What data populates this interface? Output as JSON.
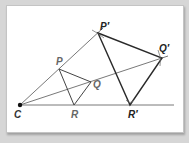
{
  "diagram": {
    "type": "dilation",
    "colors": {
      "background": "#d6d6d6",
      "panel": "#ffffff",
      "thin_line": "#555555",
      "image_line": "#333333",
      "original_label": "#666666",
      "image_label": "#222222"
    },
    "center": {
      "label": "C",
      "x": 20,
      "y": 105
    },
    "original": {
      "P": {
        "label": "P",
        "x": 59,
        "y": 69
      },
      "Q": {
        "label": "Q",
        "x": 91,
        "y": 82
      },
      "R": {
        "label": "R",
        "x": 74,
        "y": 105
      }
    },
    "image": {
      "P": {
        "label": "P′",
        "x": 98,
        "y": 33
      },
      "Q": {
        "label": "Q′",
        "x": 162,
        "y": 58
      },
      "R": {
        "label": "R′",
        "x": 130,
        "y": 105
      }
    },
    "labels": {
      "C": "C",
      "P": "P",
      "Q": "Q",
      "R": "R",
      "P_prime": "P′",
      "Q_prime": "Q′",
      "R_prime": "R′"
    }
  }
}
